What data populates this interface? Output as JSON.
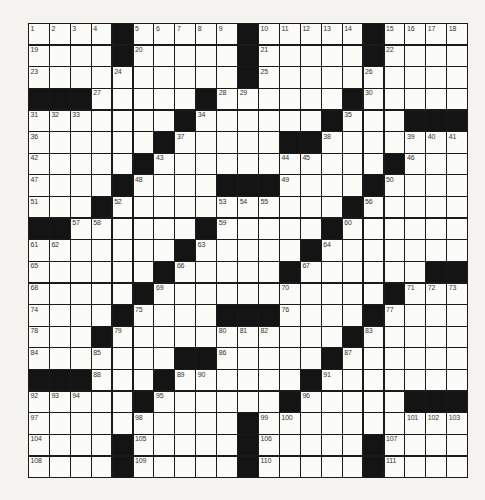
{
  "puzzle": {
    "rows": 21,
    "cols": 21,
    "layout": [
      "....#.....#.....#....",
      "....#.....#.....#....",
      "..........#..........",
      "###.....#......#.....",
      ".......#......#...###",
      "......#.....##.......",
      ".....#...........#...",
      "....#....###....#....",
      "...#...........#.....",
      "##......#.....#......",
      ".......#.....#.......",
      "......#.....#......##",
      ".....#...........#...",
      "....#....###....#....",
      "...#...........#.....",
      ".......##.....#......",
      "###...#......#.......",
      ".....#......#.....###",
      "..........#..........",
      "....#.....#.....#....",
      "....#.....#.....#...."
    ],
    "numbers": [
      [
        0,
        0,
        1
      ],
      [
        0,
        1,
        2
      ],
      [
        0,
        2,
        3
      ],
      [
        0,
        3,
        4
      ],
      [
        0,
        5,
        5
      ],
      [
        0,
        6,
        6
      ],
      [
        0,
        7,
        7
      ],
      [
        0,
        8,
        8
      ],
      [
        0,
        9,
        9
      ],
      [
        0,
        11,
        10
      ],
      [
        0,
        12,
        11
      ],
      [
        0,
        13,
        12
      ],
      [
        0,
        14,
        13
      ],
      [
        0,
        15,
        14
      ],
      [
        0,
        17,
        15
      ],
      [
        0,
        18,
        16
      ],
      [
        0,
        19,
        17
      ],
      [
        0,
        20,
        18
      ],
      [
        1,
        0,
        19
      ],
      [
        1,
        5,
        20
      ],
      [
        1,
        11,
        21
      ],
      [
        1,
        17,
        22
      ],
      [
        2,
        0,
        23
      ],
      [
        2,
        4,
        24
      ],
      [
        2,
        11,
        25
      ],
      [
        2,
        16,
        26
      ],
      [
        3,
        3,
        27
      ],
      [
        3,
        9,
        28
      ],
      [
        3,
        10,
        29
      ],
      [
        3,
        16,
        30
      ],
      [
        4,
        0,
        31
      ],
      [
        4,
        1,
        32
      ],
      [
        4,
        2,
        33
      ],
      [
        4,
        8,
        34
      ],
      [
        4,
        15,
        35
      ],
      [
        5,
        0,
        36
      ],
      [
        5,
        7,
        37
      ],
      [
        5,
        14,
        38
      ],
      [
        5,
        18,
        39
      ],
      [
        5,
        19,
        40
      ],
      [
        5,
        20,
        41
      ],
      [
        6,
        0,
        42
      ],
      [
        6,
        6,
        43
      ],
      [
        6,
        12,
        44
      ],
      [
        6,
        13,
        45
      ],
      [
        6,
        18,
        46
      ],
      [
        7,
        0,
        47
      ],
      [
        7,
        5,
        48
      ],
      [
        7,
        12,
        49
      ],
      [
        7,
        17,
        50
      ],
      [
        8,
        0,
        51
      ],
      [
        8,
        4,
        52
      ],
      [
        8,
        9,
        53
      ],
      [
        8,
        10,
        54
      ],
      [
        8,
        11,
        55
      ],
      [
        8,
        16,
        56
      ],
      [
        9,
        2,
        57
      ],
      [
        9,
        3,
        58
      ],
      [
        9,
        9,
        59
      ],
      [
        9,
        15,
        60
      ],
      [
        10,
        0,
        61
      ],
      [
        10,
        1,
        62
      ],
      [
        10,
        8,
        63
      ],
      [
        10,
        14,
        64
      ],
      [
        11,
        0,
        65
      ],
      [
        11,
        7,
        66
      ],
      [
        11,
        13,
        67
      ],
      [
        12,
        0,
        68
      ],
      [
        12,
        6,
        69
      ],
      [
        12,
        12,
        70
      ],
      [
        12,
        18,
        71
      ],
      [
        12,
        19,
        72
      ],
      [
        12,
        20,
        73
      ],
      [
        13,
        0,
        74
      ],
      [
        13,
        5,
        75
      ],
      [
        13,
        12,
        76
      ],
      [
        13,
        17,
        77
      ],
      [
        14,
        0,
        78
      ],
      [
        14,
        4,
        79
      ],
      [
        14,
        9,
        80
      ],
      [
        14,
        10,
        81
      ],
      [
        14,
        11,
        82
      ],
      [
        14,
        16,
        83
      ],
      [
        15,
        0,
        84
      ],
      [
        15,
        3,
        85
      ],
      [
        15,
        9,
        86
      ],
      [
        15,
        15,
        87
      ],
      [
        16,
        3,
        88
      ],
      [
        16,
        7,
        89
      ],
      [
        16,
        8,
        90
      ],
      [
        16,
        14,
        91
      ],
      [
        17,
        0,
        92
      ],
      [
        17,
        1,
        93
      ],
      [
        17,
        2,
        94
      ],
      [
        17,
        6,
        95
      ],
      [
        17,
        13,
        96
      ],
      [
        18,
        0,
        97
      ],
      [
        18,
        5,
        98
      ],
      [
        18,
        11,
        99
      ],
      [
        18,
        12,
        100
      ],
      [
        18,
        18,
        101
      ],
      [
        18,
        19,
        102
      ],
      [
        18,
        20,
        103
      ],
      [
        19,
        0,
        104
      ],
      [
        19,
        5,
        105
      ],
      [
        19,
        11,
        106
      ],
      [
        19,
        17,
        107
      ],
      [
        20,
        0,
        108
      ],
      [
        20,
        5,
        109
      ],
      [
        20,
        11,
        110
      ],
      [
        20,
        17,
        111
      ]
    ]
  }
}
